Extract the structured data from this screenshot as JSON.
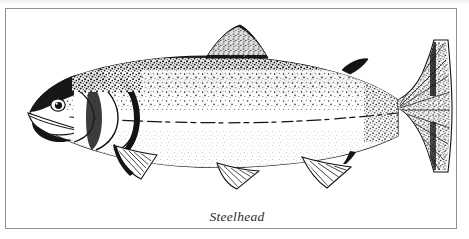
{
  "figure": {
    "caption": "Steelhead",
    "medium": "pen-and-ink stipple illustration",
    "orientation": "left-facing lateral view",
    "frame": {
      "border_color": "#8f8f8f",
      "background_color": "#ffffff"
    },
    "ink_color": "#111111",
    "parts": [
      {
        "id": "head",
        "label": "head"
      },
      {
        "id": "eye",
        "label": "eye"
      },
      {
        "id": "mouth",
        "label": "mouth"
      },
      {
        "id": "operculum",
        "label": "gill cover"
      },
      {
        "id": "lateral-line",
        "label": "lateral line"
      },
      {
        "id": "dorsal-fin",
        "label": "dorsal fin"
      },
      {
        "id": "adipose-fin",
        "label": "adipose fin"
      },
      {
        "id": "pectoral-fin",
        "label": "pectoral fin"
      },
      {
        "id": "pelvic-fin",
        "label": "pelvic fin"
      },
      {
        "id": "anal-fin",
        "label": "anal fin"
      },
      {
        "id": "caudal-fin",
        "label": "caudal fin"
      }
    ]
  }
}
